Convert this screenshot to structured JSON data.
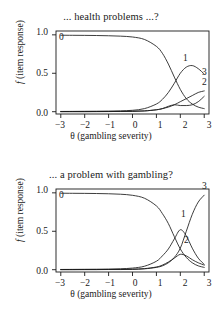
{
  "figure": {
    "background_color": "#ffffff",
    "line_color": "#1a1a1a",
    "axis_color": "#1a1a1a"
  },
  "panels": [
    {
      "id": "top",
      "title": "... health problems ...?",
      "xlabel_theta": "θ",
      "xlabel_rest": " (gambling severity)",
      "ylabel_f": "f",
      "ylabel_rest": " (item response)",
      "xticks": [
        "−3",
        "−2",
        "−1",
        "0",
        "1",
        "2",
        "3"
      ],
      "yticks": [
        "0.0",
        "0.5",
        "1.0"
      ],
      "curve_labels": [
        "0",
        "1",
        "3",
        "2"
      ]
    },
    {
      "id": "bottom",
      "title": "... a problem with gambling?",
      "xlabel_theta": "θ",
      "xlabel_rest": " (gambling severity)",
      "ylabel_f": "f",
      "ylabel_rest": " (item response)",
      "xticks": [
        "−3",
        "−2",
        "−1",
        "0",
        "1",
        "2",
        "3"
      ],
      "yticks": [
        "0.0",
        "0.5",
        "1.0"
      ],
      "curve_labels": [
        "0",
        "1",
        "2",
        "3"
      ]
    }
  ],
  "chart_data": [
    {
      "type": "line",
      "panel": "top",
      "title": "... health problems ...?",
      "xlabel": "θ (gambling severity)",
      "ylabel": "f (item response)",
      "xlim": [
        -3.2,
        3.2
      ],
      "ylim": [
        -0.03,
        1.05
      ],
      "xticks": [
        -3,
        -2,
        -1,
        0,
        1,
        2,
        3
      ],
      "yticks": [
        0.0,
        0.5,
        1.0
      ],
      "grid": false,
      "legend": "inline-curve-labels",
      "x": [
        -3.0,
        -2.5,
        -2.0,
        -1.5,
        -1.0,
        -0.5,
        0.0,
        0.5,
        1.0,
        1.25,
        1.5,
        1.75,
        2.0,
        2.25,
        2.5,
        2.75,
        3.0
      ],
      "series": [
        {
          "name": "0",
          "label_position": {
            "x": -2.85,
            "y": 0.96
          },
          "values": [
            0.995,
            0.994,
            0.993,
            0.991,
            0.988,
            0.983,
            0.972,
            0.94,
            0.85,
            0.76,
            0.62,
            0.45,
            0.29,
            0.17,
            0.1,
            0.06,
            0.04
          ]
        },
        {
          "name": "1",
          "label_position": {
            "x": 2.2,
            "y": 0.69
          },
          "values": [
            0.003,
            0.004,
            0.005,
            0.006,
            0.008,
            0.011,
            0.018,
            0.04,
            0.1,
            0.16,
            0.25,
            0.37,
            0.5,
            0.58,
            0.6,
            0.56,
            0.49
          ]
        },
        {
          "name": "2",
          "label_position": {
            "x": 3.05,
            "y": 0.3
          },
          "values": [
            0.001,
            0.001,
            0.001,
            0.002,
            0.002,
            0.003,
            0.005,
            0.01,
            0.025,
            0.04,
            0.06,
            0.09,
            0.13,
            0.17,
            0.21,
            0.25,
            0.27
          ]
        },
        {
          "name": "3",
          "label_position": {
            "x": 3.05,
            "y": 0.45
          },
          "values": [
            0.001,
            0.001,
            0.001,
            0.001,
            0.002,
            0.003,
            0.005,
            0.01,
            0.025,
            0.04,
            0.07,
            0.09,
            0.08,
            0.08,
            0.09,
            0.13,
            0.2
          ]
        }
      ]
    },
    {
      "type": "line",
      "panel": "bottom",
      "title": "... a problem with gambling?",
      "xlabel": "θ (gambling severity)",
      "ylabel": "f (item response)",
      "xlim": [
        -3.2,
        3.2
      ],
      "ylim": [
        -0.03,
        1.05
      ],
      "xticks": [
        -3,
        -2,
        -1,
        0,
        1,
        2,
        3
      ],
      "yticks": [
        0.0,
        0.5,
        1.0
      ],
      "grid": false,
      "legend": "inline-curve-labels",
      "x": [
        -3.0,
        -2.5,
        -2.0,
        -1.5,
        -1.0,
        -0.5,
        0.0,
        0.5,
        1.0,
        1.25,
        1.5,
        1.75,
        2.0,
        2.25,
        2.5,
        2.75,
        3.0
      ],
      "series": [
        {
          "name": "0",
          "label_position": {
            "x": -2.85,
            "y": 0.96
          },
          "values": [
            0.995,
            0.994,
            0.993,
            0.991,
            0.988,
            0.982,
            0.968,
            0.93,
            0.83,
            0.73,
            0.6,
            0.43,
            0.27,
            0.16,
            0.09,
            0.05,
            0.03
          ]
        },
        {
          "name": "1",
          "label_position": {
            "x": 2.2,
            "y": 0.62
          },
          "values": [
            0.003,
            0.004,
            0.005,
            0.006,
            0.008,
            0.012,
            0.021,
            0.045,
            0.11,
            0.18,
            0.27,
            0.4,
            0.52,
            0.44,
            0.28,
            0.15,
            0.07
          ]
        },
        {
          "name": "2",
          "label_position": {
            "x": 2.3,
            "y": 0.26
          },
          "values": [
            0.001,
            0.001,
            0.002,
            0.002,
            0.003,
            0.004,
            0.007,
            0.014,
            0.035,
            0.06,
            0.1,
            0.15,
            0.2,
            0.18,
            0.13,
            0.09,
            0.06
          ]
        },
        {
          "name": "3",
          "label_position": {
            "x": 3.0,
            "y": 1.0
          },
          "values": [
            0.001,
            0.001,
            0.001,
            0.001,
            0.002,
            0.002,
            0.004,
            0.011,
            0.03,
            0.05,
            0.09,
            0.16,
            0.28,
            0.5,
            0.72,
            0.88,
            0.97
          ]
        }
      ]
    }
  ]
}
